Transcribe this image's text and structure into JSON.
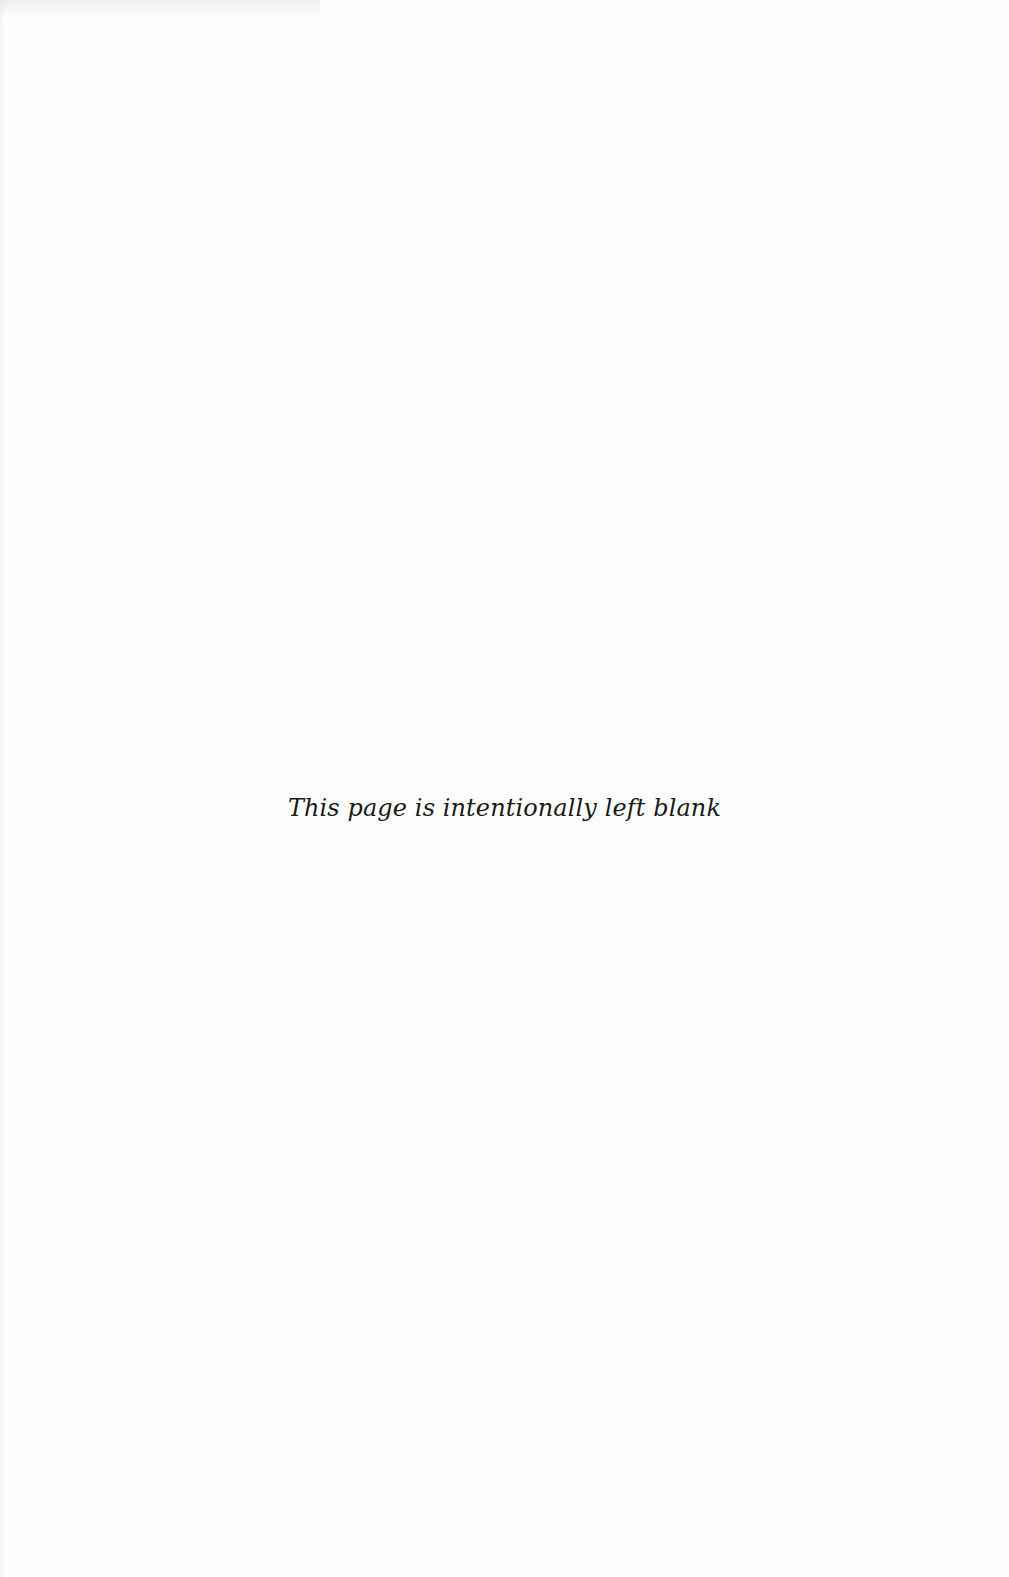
{
  "page": {
    "notice": "This page is intentionally left blank",
    "background_color": "#fefefe",
    "text_color": "#1a1a1a"
  }
}
